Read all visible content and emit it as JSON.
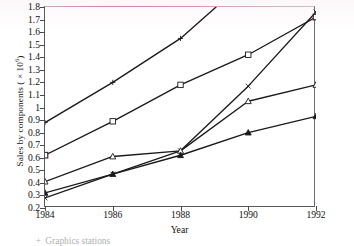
{
  "figure": {
    "ylabel_text": "Sales by components ( × 10",
    "ylabel_exponent": "6",
    "ylabel_tail": ")",
    "xlabel": "Year"
  },
  "legend": {
    "entries": [
      {
        "marker": "+",
        "label": "Graphics stations"
      }
    ]
  },
  "chart_data": {
    "type": "line",
    "title": "",
    "xlabel": "Year",
    "ylabel": "Sales by components ( × 10^6)",
    "x": [
      1984,
      1986,
      1988,
      1990,
      1992
    ],
    "xlim": [
      1984,
      1992
    ],
    "ylim": [
      0.2,
      1.8
    ],
    "xticks": [
      1984,
      1986,
      1988,
      1990,
      1992
    ],
    "yticks": [
      0.2,
      0.3,
      0.4,
      0.5,
      0.6,
      0.7,
      0.8,
      0.9,
      1.0,
      1.1,
      1.2,
      1.3,
      1.4,
      1.5,
      1.6,
      1.7,
      1.8
    ],
    "ytick_labels": [
      "0.2",
      "0.3",
      "0.4",
      "0.5",
      "0.6",
      "0.7",
      "0.8",
      "0.9",
      "1",
      "1.1",
      "1.2",
      "1.3",
      "1.4",
      "1.5",
      "1.6",
      "1.7",
      "1.8"
    ],
    "grid": false,
    "legend_position": "below-plot",
    "series": [
      {
        "name": "Graphics stations",
        "marker": "plus",
        "x": [
          1984,
          1986,
          1988,
          1989.05
        ],
        "values": [
          0.88,
          1.2,
          1.55,
          1.8
        ],
        "note": "rises off the top of the axis after 1988"
      },
      {
        "name": "series-square-open",
        "marker": "square-open",
        "x": [
          1984,
          1986,
          1988,
          1990,
          1992
        ],
        "values": [
          0.62,
          0.89,
          1.18,
          1.42,
          1.72
        ]
      },
      {
        "name": "series-cross",
        "marker": "cross",
        "x": [
          1984,
          1986,
          1988,
          1990,
          1992
        ],
        "values": [
          0.28,
          0.47,
          0.655,
          1.17,
          1.76
        ]
      },
      {
        "name": "series-triangle-open",
        "marker": "triangle-open",
        "x": [
          1984,
          1986,
          1988,
          1990,
          1992
        ],
        "values": [
          0.41,
          0.61,
          0.655,
          1.05,
          1.18
        ]
      },
      {
        "name": "series-triangle-filled",
        "marker": "triangle-filled",
        "x": [
          1984,
          1986,
          1988,
          1990,
          1992
        ],
        "values": [
          0.32,
          0.47,
          0.62,
          0.8,
          0.93
        ]
      }
    ],
    "colors": {
      "line": "#1a1a1a",
      "axis": "#5a5a5a",
      "top_rule_tint": "#e07ab8",
      "marker_accent": "#8c3a52"
    }
  }
}
